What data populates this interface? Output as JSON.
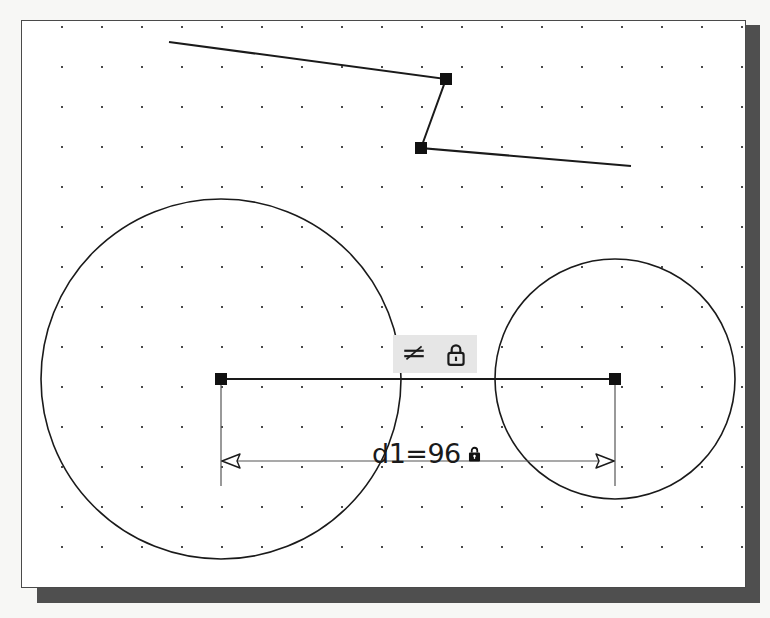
{
  "app": {
    "title": "Sketch Editor Canvas",
    "background_color": "#f7f7f5",
    "window_background": "#ffffff",
    "window_border_color": "#4a4a4a",
    "shadow_color": "#4f4f4f",
    "stroke_color": "#1a1a1a",
    "grid_dot_color": "#4a4a4a"
  },
  "canvas": {
    "grid": {
      "enabled": true,
      "spacing": 40,
      "origin_x": 40,
      "origin_y": 6,
      "dot_size": 2
    },
    "shapes": [
      {
        "name": "circle-left",
        "type": "circle",
        "cx": 199,
        "cy": 358,
        "r": 180
      },
      {
        "name": "circle-right",
        "type": "circle",
        "cx": 593,
        "cy": 358,
        "r": 120
      },
      {
        "name": "polyline-top",
        "type": "polyline",
        "points": "147,21 424,58 399,127 609,145"
      }
    ],
    "handles": [
      {
        "name": "handle-polyline-vertex-1",
        "x": 424,
        "y": 58
      },
      {
        "name": "handle-polyline-vertex-2",
        "x": 399,
        "y": 127
      },
      {
        "name": "handle-circle-left-center",
        "x": 199,
        "y": 358
      },
      {
        "name": "handle-circle-right-center",
        "x": 593,
        "y": 358
      }
    ],
    "dimension": {
      "name": "linear-dimension-d1",
      "label": "d1=96",
      "locked": true,
      "lock_icon": "lock-icon",
      "leader_line": {
        "x1": 199,
        "y1": 358,
        "x2": 593,
        "y2": 358
      },
      "extension_left": {
        "x": 199,
        "y1": 358,
        "y2": 465
      },
      "extension_right": {
        "x": 593,
        "y1": 358,
        "y2": 465
      },
      "dim_line": {
        "x1": 199,
        "y1": 440,
        "x2": 593,
        "y2": 440
      },
      "arrow_left_x": 199,
      "arrow_right_x": 593,
      "label_x": 350,
      "label_y": 415
    },
    "constraint_badges": {
      "name": "constraint-badge-group",
      "background_color": "#e6e6e6",
      "x": 371,
      "y": 314,
      "items": [
        {
          "name": "equal-constraint-icon",
          "label": "Equal / Horizontal constraint"
        },
        {
          "name": "lock-constraint-icon",
          "label": "Lock constraint"
        }
      ]
    }
  }
}
